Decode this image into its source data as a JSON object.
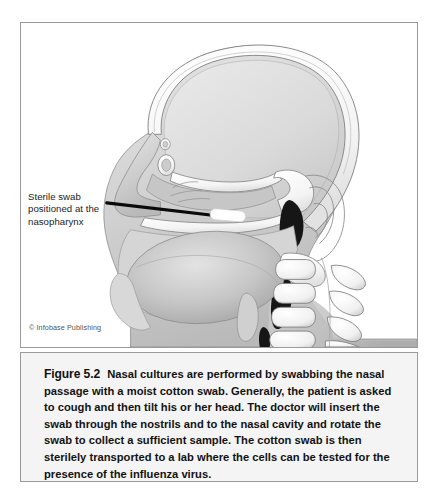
{
  "figure": {
    "credit": "© Infobase Publishing",
    "callout": {
      "line1": "Sterile swab",
      "line2": "positioned at the",
      "line3": "nasopharynx"
    },
    "caption": {
      "figure_number": "Figure 5.2",
      "body": "Nasal cultures are performed by swabbing the nasal passage with a moist cotton swab. Generally, the patient is asked to cough and then tilt his or her head. The doctor will insert the swab through the nostrils and to the nasal cavity and rotate the swab to collect a sufficient sample. The cotton swab is then sterilely transported to a lab where the cells can be tested for the presence of the influenza virus."
    },
    "illustration": {
      "title": "Sagittal cross-section of a human head showing a nasal swab inserted to the nasopharynx",
      "parts": [
        "skull-cranial-vault",
        "brain-cavity",
        "frontal-sinus",
        "nasal-cavity",
        "nasal-turbinates",
        "hard-palate",
        "nasopharynx-airway",
        "oral-cavity",
        "tongue",
        "epiglottis",
        "pharynx",
        "ear",
        "cervical-vertebrae",
        "neck-soft-tissue",
        "sterile-swab-shaft",
        "sterile-swab-cotton-tip"
      ],
      "colors": {
        "bone": "#fbfbfb",
        "soft_tissue": "#c9c9c9",
        "brain": "#dcdcdc",
        "outline": "#6e6e6e",
        "airway_dark": "#1a1a1a",
        "swab_shaft": "#0a0a0a",
        "swab_tip": "#ffffff",
        "panel_border": "#9a9a9a",
        "caption_bg": "#f4f4f4"
      }
    }
  }
}
